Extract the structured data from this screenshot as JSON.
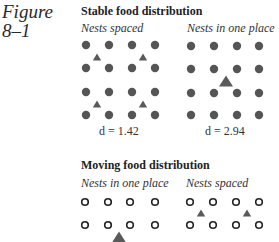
{
  "figure": {
    "label_line1": "Figure",
    "label_line2": "8–1"
  },
  "stable": {
    "title": "Stable food distribution",
    "left": {
      "label": "Nests spaced",
      "d_value": "d = 1.42",
      "nest_style": "filled",
      "nests": [
        [
          86,
          45
        ],
        [
          109,
          45
        ],
        [
          132,
          45
        ],
        [
          155,
          45
        ],
        [
          86,
          68
        ],
        [
          109,
          68
        ],
        [
          132,
          68
        ],
        [
          155,
          68
        ],
        [
          86,
          92
        ],
        [
          109,
          92
        ],
        [
          132,
          92
        ],
        [
          155,
          92
        ],
        [
          86,
          115
        ],
        [
          109,
          115
        ],
        [
          132,
          115
        ],
        [
          155,
          115
        ]
      ],
      "food": [
        {
          "x": 97,
          "y": 57,
          "size": "small"
        },
        {
          "x": 143,
          "y": 57,
          "size": "small"
        },
        {
          "x": 97,
          "y": 104,
          "size": "small"
        },
        {
          "x": 143,
          "y": 104,
          "size": "small"
        }
      ]
    },
    "right": {
      "label": "Nests in one place",
      "d_value": "d = 2.94",
      "nest_style": "filled",
      "nests": [
        [
          191,
          46
        ],
        [
          214,
          46
        ],
        [
          237,
          46
        ],
        [
          259,
          46
        ],
        [
          191,
          69
        ],
        [
          214,
          69
        ],
        [
          237,
          69
        ],
        [
          259,
          69
        ],
        [
          191,
          93
        ],
        [
          214,
          93
        ],
        [
          237,
          93
        ],
        [
          259,
          93
        ],
        [
          191,
          115
        ],
        [
          214,
          115
        ],
        [
          237,
          115
        ],
        [
          259,
          115
        ]
      ],
      "food": [
        {
          "x": 226,
          "y": 81,
          "size": "large"
        }
      ]
    }
  },
  "moving": {
    "title": "Moving food distribution",
    "left": {
      "label": "Nests in one place",
      "nest_style": "open",
      "nests": [
        [
          85,
          202
        ],
        [
          108,
          202
        ],
        [
          130,
          202
        ],
        [
          155,
          202
        ],
        [
          85,
          225
        ],
        [
          108,
          225
        ],
        [
          130,
          225
        ],
        [
          155,
          225
        ]
      ],
      "food": [
        {
          "x": 119,
          "y": 237,
          "size": "large"
        }
      ]
    },
    "right": {
      "label": "Nests spaced",
      "nest_style": "open",
      "nests": [
        [
          190,
          202
        ],
        [
          213,
          202
        ],
        [
          236,
          202
        ],
        [
          259,
          202
        ],
        [
          190,
          225
        ],
        [
          213,
          225
        ],
        [
          236,
          225
        ],
        [
          259,
          225
        ]
      ],
      "food": [
        {
          "x": 201,
          "y": 213,
          "size": "small"
        },
        {
          "x": 247,
          "y": 213,
          "size": "small"
        }
      ]
    }
  },
  "colors": {
    "nest_fill": "#555555",
    "food_fill": "#5a5a5a",
    "open_stroke": "#222222"
  }
}
